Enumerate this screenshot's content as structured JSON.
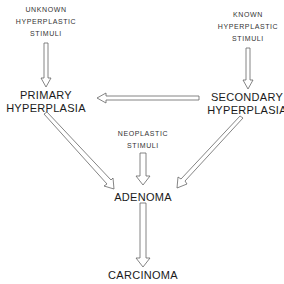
{
  "diagram": {
    "nodes": {
      "unknown_stimuli": [
        "UNKNOWN",
        "HYPERPLASTIC",
        "STIMULI"
      ],
      "known_stimuli": [
        "KNOWN",
        "HYPERPLASTIC",
        "STIMULI"
      ],
      "primary": [
        "PRIMARY",
        "HYPERPLASIA"
      ],
      "secondary": [
        "SECONDARY",
        "HYPERPLASIA"
      ],
      "neoplastic_stimuli": [
        "NEOPLASTIC",
        "STIMULI"
      ],
      "adenoma": "ADENOMA",
      "carcinoma": "CARCINOMA"
    },
    "edges": [
      {
        "from": "UNKNOWN HYPERPLASTIC STIMULI",
        "to": "PRIMARY HYPERPLASIA"
      },
      {
        "from": "KNOWN HYPERPLASTIC STIMULI",
        "to": "SECONDARY HYPERPLASIA"
      },
      {
        "from": "SECONDARY HYPERPLASIA",
        "to": "PRIMARY HYPERPLASIA"
      },
      {
        "from": "PRIMARY HYPERPLASIA",
        "to": "ADENOMA"
      },
      {
        "from": "SECONDARY HYPERPLASIA",
        "to": "ADENOMA"
      },
      {
        "from": "NEOPLASTIC STIMULI",
        "to": "ADENOMA"
      },
      {
        "from": "ADENOMA",
        "to": "CARCINOMA"
      }
    ]
  }
}
